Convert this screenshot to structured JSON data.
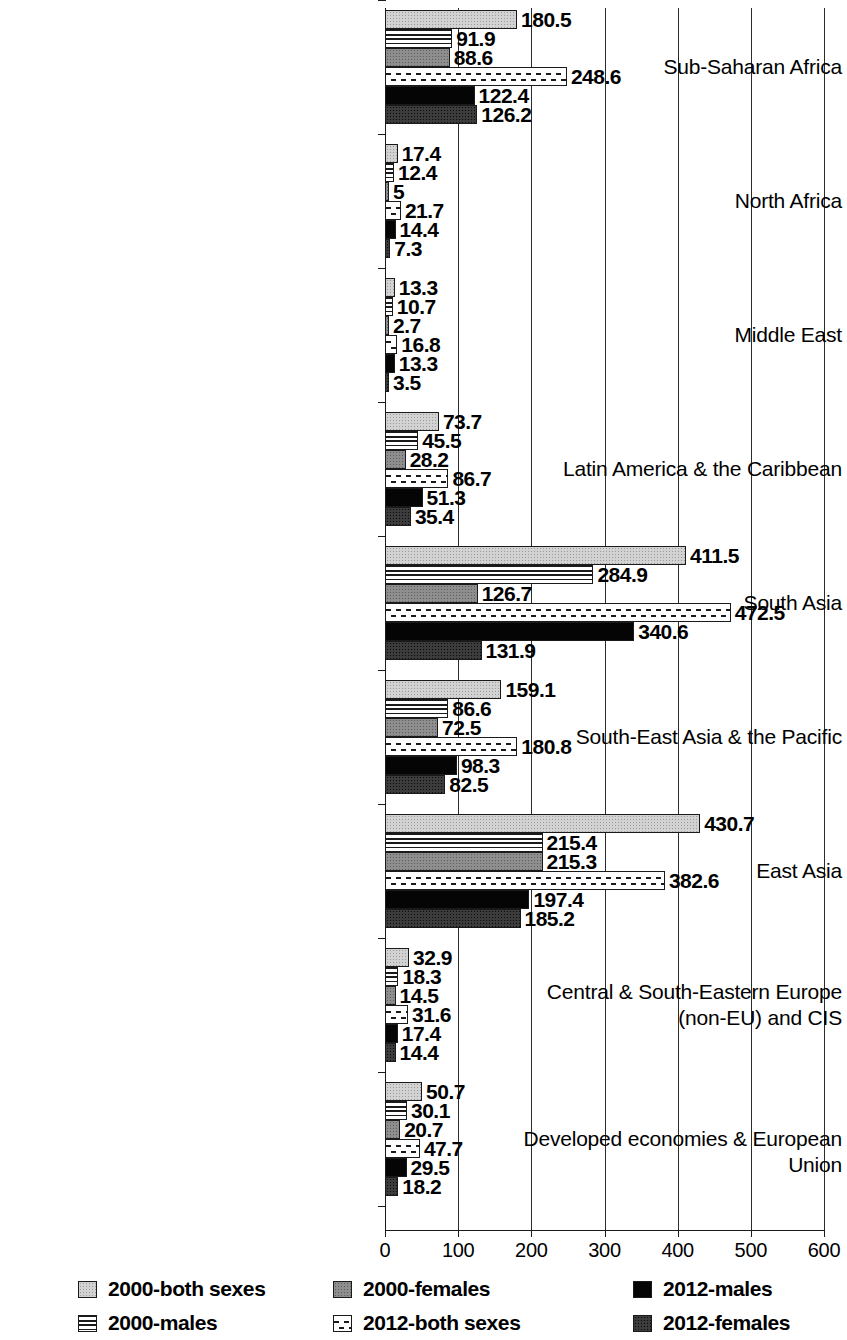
{
  "chart_data": {
    "type": "bar",
    "orientation": "horizontal",
    "title": "",
    "xlabel": "",
    "ylabel": "",
    "xlim": [
      0,
      600
    ],
    "xticks": [
      0,
      100,
      200,
      300,
      400,
      500,
      600
    ],
    "xtick_labels": [
      "0",
      "100",
      "200",
      "300",
      "400",
      "500",
      "600"
    ],
    "grid": true,
    "grid_axis": "x",
    "legend_position": "bottom",
    "categories": [
      "Sub-Saharan Africa",
      "North Africa",
      "Middle East",
      "Latin America & the Caribbean",
      "South Asia",
      "South-East Asia & the Pacific",
      "East Asia",
      "Central & South-Eastern Europe (non-EU) and CIS",
      "Developed economies & European Union"
    ],
    "category_lines": [
      [
        "Sub-Saharan Africa"
      ],
      [
        "North Africa"
      ],
      [
        "Middle East"
      ],
      [
        "Latin America & the Caribbean"
      ],
      [
        "South Asia"
      ],
      [
        "South-East Asia & the Pacific"
      ],
      [
        "East Asia"
      ],
      [
        "Central & South-Eastern Europe",
        "(non-EU) and CIS"
      ],
      [
        "Developed economies & European Union"
      ]
    ],
    "series": [
      {
        "name": "2000-both sexes",
        "pattern": "p-both2000",
        "values": [
          180.5,
          17.4,
          13.3,
          73.7,
          411.5,
          159.1,
          430.7,
          32.9,
          50.7
        ],
        "labels": [
          "180.5",
          "17.4",
          "13.3",
          "73.7",
          "411.5",
          "159.1",
          "430.7",
          "32.9",
          "50.7"
        ]
      },
      {
        "name": "2000-males",
        "pattern": "p-males2000",
        "values": [
          91.9,
          12.4,
          10.7,
          45.5,
          284.9,
          86.6,
          215.4,
          18.3,
          30.1
        ],
        "labels": [
          "91.9",
          "12.4",
          "10.7",
          "45.5",
          "284.9",
          "86.6",
          "215.4",
          "18.3",
          "30.1"
        ]
      },
      {
        "name": "2000-females",
        "pattern": "p-females2000",
        "values": [
          88.6,
          5,
          2.7,
          28.2,
          126.7,
          72.5,
          215.3,
          14.5,
          20.7
        ],
        "labels": [
          "88.6",
          "5",
          "2.7",
          "28.2",
          "126.7",
          "72.5",
          "215.3",
          "14.5",
          "20.7"
        ]
      },
      {
        "name": "2012-both sexes",
        "pattern": "p-both2012",
        "values": [
          248.6,
          21.7,
          16.8,
          86.7,
          472.5,
          180.8,
          382.6,
          31.6,
          47.7
        ],
        "labels": [
          "248.6",
          "21.7",
          "16.8",
          "86.7",
          "472.5",
          "180.8",
          "382.6",
          "31.6",
          "47.7"
        ]
      },
      {
        "name": "2012-males",
        "pattern": "p-males2012",
        "values": [
          122.4,
          14.4,
          13.3,
          51.3,
          340.6,
          98.3,
          197.4,
          17.4,
          29.5
        ],
        "labels": [
          "122.4",
          "14.4",
          "13.3",
          "51.3",
          "340.6",
          "98.3",
          "197.4",
          "17.4",
          "29.5"
        ]
      },
      {
        "name": "2012-females",
        "pattern": "p-females2012",
        "values": [
          126.2,
          7.3,
          3.5,
          35.4,
          131.9,
          82.5,
          185.2,
          14.4,
          18.2
        ],
        "labels": [
          "126.2",
          "7.3",
          "3.5",
          "35.4",
          "131.9",
          "82.5",
          "185.2",
          "14.4",
          "18.2"
        ]
      }
    ]
  },
  "legend": {
    "columns": [
      [
        {
          "label": "2000-both sexes",
          "pattern": "p-both2000",
          "swatch_name": "legend-swatch-2000-both-sexes"
        },
        {
          "label": "2000-males",
          "pattern": "p-males2000",
          "swatch_name": "legend-swatch-2000-males"
        }
      ],
      [
        {
          "label": "2000-females",
          "pattern": "p-females2000",
          "swatch_name": "legend-swatch-2000-females"
        },
        {
          "label": "2012-both sexes",
          "pattern": "p-both2012",
          "swatch_name": "legend-swatch-2012-both-sexes"
        }
      ],
      [
        {
          "label": "2012-males",
          "pattern": "p-males2012",
          "swatch_name": "legend-swatch-2012-males"
        },
        {
          "label": "2012-females",
          "pattern": "p-females2012",
          "swatch_name": "legend-swatch-2012-females"
        }
      ]
    ]
  },
  "colors": {
    "axis": "#1a1a1a",
    "both2000": "#d2d2d2",
    "males2000": "#ffffff",
    "females2000": "#8e8e8e",
    "both2012": "#ffffff",
    "males2012": "#050505",
    "females2012": "#3c3c3c",
    "background": "#ffffff"
  }
}
